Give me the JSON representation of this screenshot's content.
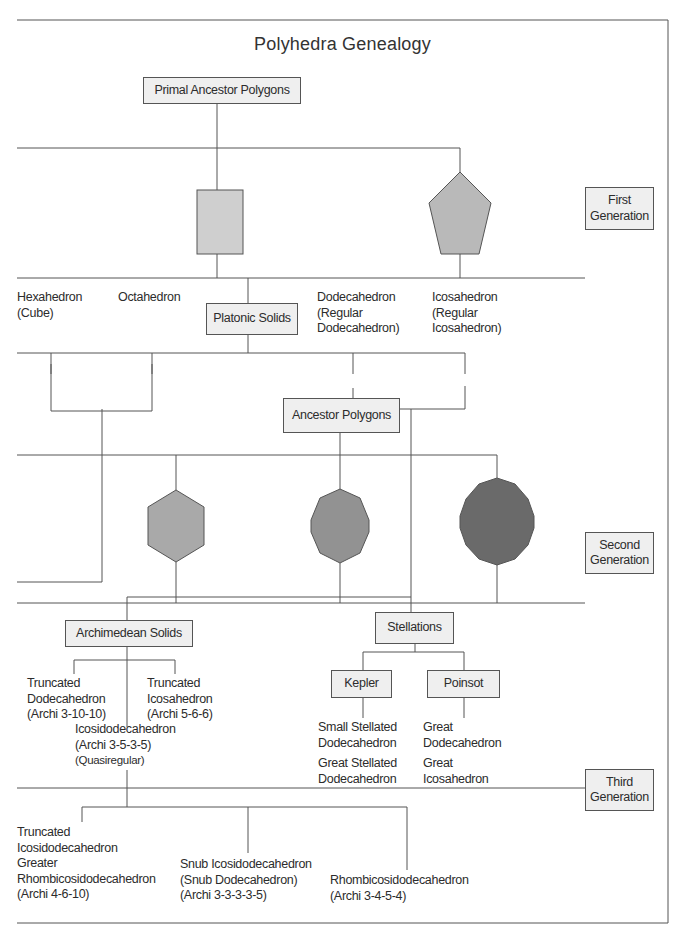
{
  "title": "Polyhedra Genealogy",
  "colors": {
    "line": "#555555",
    "box_fill": "#efefef",
    "square_fill": "#cfcfcf",
    "pentagon_fill": "#b9b9b9",
    "hexagon_fill": "#a9a9a9",
    "octagon_fill": "#929292",
    "dodecagon_fill": "#6a6a6a"
  },
  "generations": {
    "first": [
      "First",
      "Generation"
    ],
    "second": [
      "Second",
      "Generation"
    ],
    "third": [
      "Third",
      "Generation"
    ]
  },
  "nodes": {
    "primal_ancestor": "Primal Ancestor Polygons",
    "platonic_solids": "Platonic Solids",
    "ancestor_polygons": "Ancestor Polygons",
    "archimedean_solids": "Archimedean Solids",
    "stellations": "Stellations",
    "kepler": "Kepler",
    "poinsot": "Poinsot"
  },
  "primal_polygons": [
    "square",
    "pentagon"
  ],
  "ancestor_polygon_shapes": [
    "hexagon",
    "octagon",
    "dodecagon"
  ],
  "platonic": [
    {
      "lines": [
        "Hexahedron",
        "(Cube)"
      ]
    },
    {
      "lines": [
        "Octahedron"
      ]
    },
    {
      "lines": [
        "Dodecahedron",
        "(Regular",
        "Dodecahedron)"
      ]
    },
    {
      "lines": [
        "Icosahedron",
        "(Regular",
        "Icosahedron)"
      ]
    }
  ],
  "archimedean": [
    {
      "lines": [
        "Truncated",
        "Dodecahedron",
        "(Archi 3-10-10)"
      ]
    },
    {
      "lines": [
        "Truncated",
        "Icosahedron",
        "(Archi 5-6-6)"
      ]
    },
    {
      "lines": [
        "Icosidodecahedron",
        "(Archi 3-5-3-5)",
        "(Quasiregular)"
      ]
    }
  ],
  "kepler_solids": [
    {
      "lines": [
        "Small Stellated",
        "Dodecahedron"
      ]
    },
    {
      "lines": [
        "Great Stellated",
        "Dodecahedron"
      ]
    }
  ],
  "poinsot_solids": [
    {
      "lines": [
        "Great",
        "Dodecahedron"
      ]
    },
    {
      "lines": [
        "Great",
        "Icosahedron"
      ]
    }
  ],
  "third_gen": [
    {
      "lines": [
        "Truncated",
        "Icosidodecahedron",
        "Greater",
        "Rhombicosidodecahedron",
        "(Archi 4-6-10)"
      ]
    },
    {
      "lines": [
        "Snub Icosidodecahedron",
        "(Snub Dodecahedron)",
        "(Archi 3-3-3-3-5)"
      ]
    },
    {
      "lines": [
        "Rhombicosidodecahedron",
        "(Archi 3-4-5-4)"
      ]
    }
  ]
}
